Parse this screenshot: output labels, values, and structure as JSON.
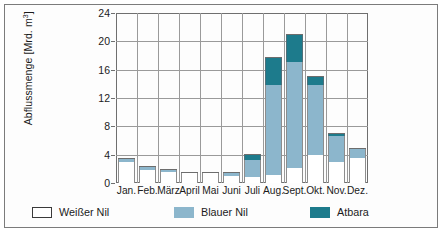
{
  "chart_data": {
    "type": "bar",
    "stacked": true,
    "title": "",
    "xlabel": "",
    "ylabel": "Abflussmenge [Mrd. m3]",
    "ylabel_text": "Abflussmenge [Mrd. m",
    "ylabel_sup": "3",
    "ylabel_tail": "]",
    "ylim": [
      0,
      24
    ],
    "yticks": [
      0,
      4,
      8,
      12,
      16,
      20,
      24
    ],
    "ytick_labels": [
      "0",
      "4",
      "8",
      "12",
      "16",
      "20",
      "24"
    ],
    "grid": true,
    "legend_position": "below",
    "categories": [
      "Jan.",
      "Feb.",
      "März",
      "April",
      "Mai",
      "Juni",
      "Juli",
      "Aug.",
      "Sept.",
      "Okt.",
      "Nov.",
      "Dez."
    ],
    "series": [
      {
        "name": "Weißer Nil",
        "color": "#ffffff",
        "values": [
          2.9,
          1.9,
          1.6,
          1.4,
          1.4,
          1.0,
          0.8,
          1.2,
          2.1,
          3.9,
          2.9,
          3.5
        ]
      },
      {
        "name": "Blauer Nil",
        "color": "#8cb6cc",
        "values": [
          0.5,
          0.4,
          0.4,
          0.1,
          0.1,
          0.6,
          2.4,
          12.6,
          15.0,
          10.0,
          3.8,
          1.5
        ]
      },
      {
        "name": "Atbara",
        "color": "#1d7b8c",
        "values": [
          0.2,
          0.1,
          0.0,
          0.0,
          0.0,
          0.0,
          0.9,
          4.0,
          3.9,
          1.2,
          0.4,
          0.0
        ]
      }
    ],
    "totals": [
      3.6,
      2.4,
      2.0,
      1.5,
      1.5,
      1.6,
      4.1,
      17.8,
      21.0,
      15.1,
      7.1,
      5.0
    ]
  },
  "legend": {
    "items": [
      {
        "label": "Weißer Nil",
        "swatch": "white-swatch"
      },
      {
        "label": "Blauer Nil",
        "swatch": "blue-swatch"
      },
      {
        "label": "Atbara",
        "swatch": "teal-swatch"
      }
    ]
  },
  "colors": {
    "white_nile": "#ffffff",
    "blue_nile": "#8cb6cc",
    "atbara": "#1d7b8c",
    "axis": "#6f6f6f",
    "grid": "#9a9a9a",
    "text": "#1b1b1b",
    "frame": "#7b7b7b"
  }
}
